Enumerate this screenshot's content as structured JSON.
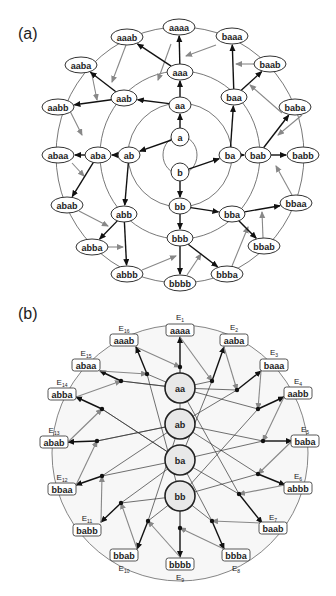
{
  "panels": [
    {
      "id": "a",
      "label": "(a)"
    },
    {
      "id": "b",
      "label": "(b)"
    }
  ],
  "diagram_a": {
    "center": [
      180,
      155
    ],
    "rings": [
      {
        "r": 25,
        "cx": 180,
        "cy": 155,
        "note": "inner circle through a and b"
      },
      {
        "r": 52
      },
      {
        "r": 84
      },
      {
        "r": 127
      }
    ],
    "nodes": [
      {
        "id": "a",
        "label": "a",
        "x": 180,
        "y": 137,
        "rx": 9,
        "ry": 9
      },
      {
        "id": "b",
        "label": "b",
        "x": 180,
        "y": 172,
        "rx": 9,
        "ry": 9
      },
      {
        "id": "aa",
        "label": "aa",
        "x": 180,
        "y": 105,
        "rx": 11,
        "ry": 8
      },
      {
        "id": "ab",
        "label": "ab",
        "x": 129,
        "y": 155,
        "rx": 11,
        "ry": 8
      },
      {
        "id": "ba",
        "label": "ba",
        "x": 230,
        "y": 155,
        "rx": 11,
        "ry": 8
      },
      {
        "id": "bb",
        "label": "bb",
        "x": 180,
        "y": 206,
        "rx": 11,
        "ry": 8
      },
      {
        "id": "aaa",
        "label": "aaa",
        "x": 180,
        "y": 72,
        "rx": 13,
        "ry": 8
      },
      {
        "id": "aab",
        "label": "aab",
        "x": 124,
        "y": 98,
        "rx": 13,
        "ry": 8
      },
      {
        "id": "aba",
        "label": "aba",
        "x": 98,
        "y": 155,
        "rx": 13,
        "ry": 8
      },
      {
        "id": "abb",
        "label": "abb",
        "x": 124,
        "y": 214,
        "rx": 13,
        "ry": 8
      },
      {
        "id": "baa",
        "label": "baa",
        "x": 234,
        "y": 97,
        "rx": 13,
        "ry": 8
      },
      {
        "id": "bab",
        "label": "bab",
        "x": 258,
        "y": 155,
        "rx": 13,
        "ry": 8
      },
      {
        "id": "bba",
        "label": "bba",
        "x": 232,
        "y": 214,
        "rx": 13,
        "ry": 8
      },
      {
        "id": "bbb",
        "label": "bbb",
        "x": 180,
        "y": 238,
        "rx": 13,
        "ry": 8
      },
      {
        "id": "aaaa",
        "label": "aaaa",
        "x": 179,
        "y": 27,
        "rx": 16,
        "ry": 8
      },
      {
        "id": "aaab",
        "label": "aaab",
        "x": 127,
        "y": 37,
        "rx": 16,
        "ry": 8
      },
      {
        "id": "aaba",
        "label": "aaba",
        "x": 81,
        "y": 65,
        "rx": 16,
        "ry": 8
      },
      {
        "id": "aabb",
        "label": "aabb",
        "x": 58,
        "y": 107,
        "rx": 16,
        "ry": 8
      },
      {
        "id": "abaa",
        "label": "abaa",
        "x": 58,
        "y": 155,
        "rx": 16,
        "ry": 8
      },
      {
        "id": "abab",
        "label": "abab",
        "x": 67,
        "y": 205,
        "rx": 16,
        "ry": 8
      },
      {
        "id": "abba",
        "label": "abba",
        "x": 92,
        "y": 247,
        "rx": 16,
        "ry": 8
      },
      {
        "id": "abbb",
        "label": "abbb",
        "x": 127,
        "y": 274,
        "rx": 16,
        "ry": 8
      },
      {
        "id": "bbbb",
        "label": "bbbb",
        "x": 180,
        "y": 283,
        "rx": 16,
        "ry": 8
      },
      {
        "id": "bbba",
        "label": "bbba",
        "x": 227,
        "y": 274,
        "rx": 16,
        "ry": 8
      },
      {
        "id": "bbab",
        "label": "bbab",
        "x": 264,
        "y": 246,
        "rx": 16,
        "ry": 8
      },
      {
        "id": "bbaa",
        "label": "bbaa",
        "x": 296,
        "y": 203,
        "rx": 16,
        "ry": 8
      },
      {
        "id": "babb",
        "label": "babb",
        "x": 303,
        "y": 155,
        "rx": 16,
        "ry": 8
      },
      {
        "id": "baba",
        "label": "baba",
        "x": 295,
        "y": 107,
        "rx": 16,
        "ry": 8
      },
      {
        "id": "baab",
        "label": "baab",
        "x": 270,
        "y": 64,
        "rx": 16,
        "ry": 8
      },
      {
        "id": "baaa",
        "label": "baaa",
        "x": 232,
        "y": 36,
        "rx": 16,
        "ry": 8
      }
    ],
    "black_edges": [
      [
        "a",
        "aa"
      ],
      [
        "a",
        "ab"
      ],
      [
        "b",
        "ba"
      ],
      [
        "b",
        "bb"
      ],
      [
        "aa",
        "aaa"
      ],
      [
        "aa",
        "aab"
      ],
      [
        "ab",
        "aba"
      ],
      [
        "ab",
        "abb"
      ],
      [
        "ba",
        "baa"
      ],
      [
        "ba",
        "bab"
      ],
      [
        "bb",
        "bba"
      ],
      [
        "bb",
        "bbb"
      ],
      [
        "aaa",
        "aaaa"
      ],
      [
        "aaa",
        "aaab"
      ],
      [
        "aab",
        "aaba"
      ],
      [
        "aab",
        "aabb"
      ],
      [
        "aba",
        "abaa"
      ],
      [
        "aba",
        "abab"
      ],
      [
        "abb",
        "abba"
      ],
      [
        "abb",
        "abbb"
      ],
      [
        "baa",
        "baaa"
      ],
      [
        "baa",
        "baab"
      ],
      [
        "bab",
        "baba"
      ],
      [
        "bab",
        "babb"
      ],
      [
        "bba",
        "bbaa"
      ],
      [
        "bba",
        "bbab"
      ],
      [
        "bbb",
        "bbba"
      ],
      [
        "bbb",
        "bbbb"
      ]
    ],
    "gray_arrows": [
      {
        "from": [
          171,
          44
        ],
        "to": [
          158,
          80
        ]
      },
      {
        "from": [
          216,
          45
        ],
        "to": [
          186,
          56
        ]
      },
      {
        "from": [
          258,
          64
        ],
        "to": [
          236,
          64
        ]
      },
      {
        "from": [
          126,
          45
        ],
        "to": [
          112,
          82
        ]
      },
      {
        "from": [
          92,
          75
        ],
        "to": [
          97,
          100
        ]
      },
      {
        "from": [
          282,
          113
        ],
        "to": [
          250,
          85
        ]
      },
      {
        "from": [
          302,
          115
        ],
        "to": [
          278,
          135
        ]
      },
      {
        "from": [
          72,
          163
        ],
        "to": [
          84,
          176
        ]
      },
      {
        "from": [
          70,
          111
        ],
        "to": [
          82,
          135
        ]
      },
      {
        "from": [
          79,
          211
        ],
        "to": [
          108,
          226
        ]
      },
      {
        "from": [
          104,
          247
        ],
        "to": [
          123,
          247
        ]
      },
      {
        "from": [
          142,
          270
        ],
        "to": [
          176,
          256
        ]
      },
      {
        "from": [
          187,
          275
        ],
        "to": [
          201,
          254
        ]
      },
      {
        "from": [
          232,
          266
        ],
        "to": [
          248,
          227
        ]
      },
      {
        "from": [
          263,
          238
        ],
        "to": [
          262,
          212
        ]
      },
      {
        "from": [
          292,
          195
        ],
        "to": [
          276,
          166
        ]
      }
    ]
  },
  "diagram_b": {
    "circle": {
      "cx": 180,
      "cy": 453,
      "r": 128
    },
    "center_nodes": [
      {
        "id": "aa",
        "label": "aa",
        "x": 180,
        "y": 388,
        "r": 15
      },
      {
        "id": "ab",
        "label": "ab",
        "x": 180,
        "y": 424,
        "r": 15
      },
      {
        "id": "ba",
        "label": "ba",
        "x": 180,
        "y": 460,
        "r": 15
      },
      {
        "id": "bb",
        "label": "bb",
        "x": 180,
        "y": 496,
        "r": 15
      }
    ],
    "edge_nodes": [
      {
        "e": "E",
        "sub": "1",
        "label": "aaaa",
        "x": 180,
        "y": 330,
        "lx": 180,
        "ly": 320,
        "anchor": [
          180,
          337
        ]
      },
      {
        "e": "E",
        "sub": "2",
        "label": "aaba",
        "x": 234,
        "y": 340,
        "lx": 234,
        "ly": 330,
        "anchor": [
          224,
          347
        ]
      },
      {
        "e": "E",
        "sub": "3",
        "label": "baaa",
        "x": 274,
        "y": 365,
        "lx": 274,
        "ly": 355,
        "anchor": [
          261,
          371
        ]
      },
      {
        "e": "E",
        "sub": "4",
        "label": "aabb",
        "x": 298,
        "y": 393,
        "lx": 298,
        "ly": 384,
        "anchor": [
          284,
          397
        ]
      },
      {
        "e": "E",
        "sub": "5",
        "label": "baba",
        "x": 305,
        "y": 441,
        "lx": 305,
        "ly": 432,
        "anchor": [
          292,
          441
        ]
      },
      {
        "e": "E",
        "sub": "6",
        "label": "abbb",
        "x": 298,
        "y": 488,
        "lx": 298,
        "ly": 479,
        "anchor": [
          285,
          485
        ]
      },
      {
        "e": "E",
        "sub": "7",
        "label": "baab",
        "x": 273,
        "y": 528,
        "lx": 273,
        "ly": 520,
        "anchor": [
          262,
          523
        ]
      },
      {
        "e": "E",
        "sub": "8",
        "label": "bbba",
        "x": 236,
        "y": 555,
        "lx": 236,
        "ly": 571,
        "anchor": [
          224,
          549
        ]
      },
      {
        "e": "E",
        "sub": "9",
        "label": "bbbb",
        "x": 180,
        "y": 564,
        "lx": 180,
        "ly": 580,
        "anchor": [
          180,
          557
        ]
      },
      {
        "e": "E",
        "sub": "10",
        "label": "bbab",
        "x": 124,
        "y": 555,
        "lx": 124,
        "ly": 571,
        "anchor": [
          137,
          549
        ]
      },
      {
        "e": "E",
        "sub": "11",
        "label": "babb",
        "x": 87,
        "y": 530,
        "lx": 87,
        "ly": 521,
        "anchor": [
          101,
          522
        ]
      },
      {
        "e": "E",
        "sub": "12",
        "label": "bbaa",
        "x": 62,
        "y": 489,
        "lx": 62,
        "ly": 480,
        "anchor": [
          76,
          485
        ]
      },
      {
        "e": "E",
        "sub": "13",
        "label": "abab",
        "x": 54,
        "y": 442,
        "lx": 54,
        "ly": 433,
        "anchor": [
          68,
          442
        ]
      },
      {
        "e": "E",
        "sub": "14",
        "label": "abba",
        "x": 62,
        "y": 394,
        "lx": 62,
        "ly": 385,
        "anchor": [
          76,
          397
        ]
      },
      {
        "e": "E",
        "sub": "15",
        "label": "abaa",
        "x": 86,
        "y": 365,
        "lx": 86,
        "ly": 356,
        "anchor": [
          100,
          371
        ]
      },
      {
        "e": "E",
        "sub": "16",
        "label": "aaab",
        "x": 124,
        "y": 340,
        "lx": 124,
        "ly": 331,
        "anchor": [
          136,
          347
        ]
      }
    ],
    "junctions": [
      [
        180,
        367
      ],
      [
        212,
        381
      ],
      [
        237,
        390
      ],
      [
        258,
        409
      ],
      [
        263,
        441
      ],
      [
        258,
        474
      ],
      [
        239,
        494
      ],
      [
        212,
        521
      ],
      [
        180,
        528
      ],
      [
        148,
        521
      ],
      [
        121,
        503
      ],
      [
        102,
        476
      ],
      [
        97,
        441
      ],
      [
        102,
        409
      ],
      [
        121,
        381
      ],
      [
        147,
        374
      ]
    ]
  }
}
